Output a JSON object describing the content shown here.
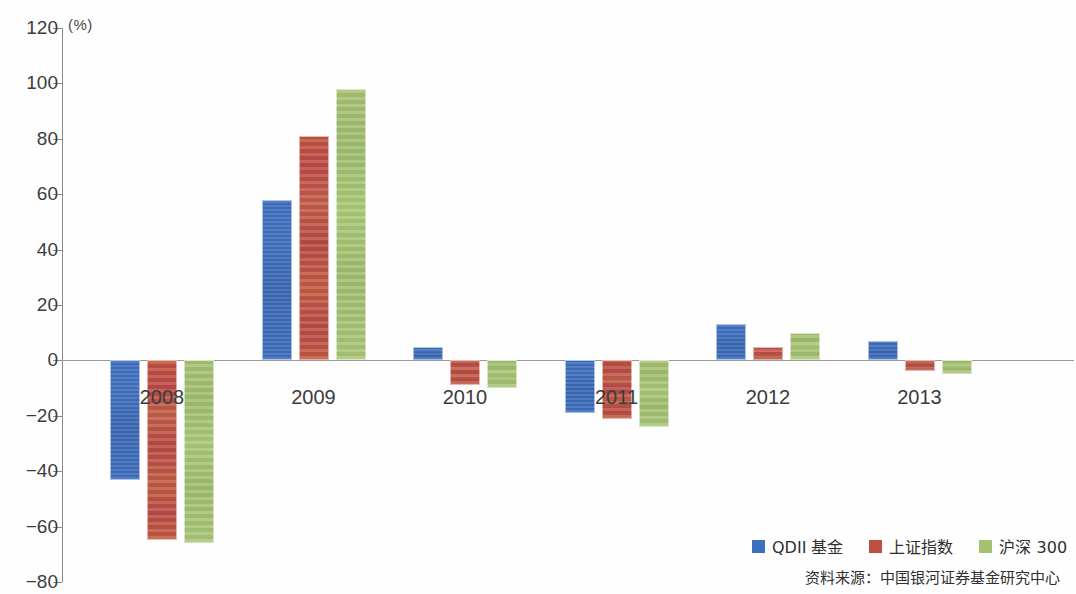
{
  "axis": {
    "unit_label": "(%)",
    "y_ticks": [
      120,
      100,
      80,
      60,
      40,
      20,
      0,
      -20,
      -40,
      -60,
      -80
    ],
    "y_tick_labels": [
      "120",
      "100",
      "80",
      "60",
      "40",
      "20",
      "0",
      "−20",
      "−40",
      "−60",
      "−80"
    ]
  },
  "legend": {
    "items": [
      {
        "label": "QDII 基金",
        "color": "#3f6fbf"
      },
      {
        "label": "上证指数",
        "color": "#bd5043"
      },
      {
        "label": "沪深 300",
        "color": "#a5c273"
      }
    ]
  },
  "source_note": "资料来源：中国银河证券基金研究中心",
  "chart_data": {
    "type": "bar",
    "title": "",
    "xlabel": "",
    "ylabel": "(%)",
    "ylim": [
      -80,
      120
    ],
    "ytick_step": 20,
    "grid": false,
    "legend_position": "bottom-right",
    "categories": [
      "2008",
      "2009",
      "2010",
      "2011",
      "2012",
      "2013"
    ],
    "series": [
      {
        "name": "QDII 基金",
        "color": "#3f6fbf",
        "values": [
          -43,
          58,
          5,
          -19,
          13,
          7
        ]
      },
      {
        "name": "上证指数",
        "color": "#bd5043",
        "values": [
          -65,
          81,
          -9,
          -21,
          5,
          -4
        ]
      },
      {
        "name": "沪深 300",
        "color": "#a5c273",
        "values": [
          -66,
          98,
          -10,
          -24,
          10,
          -5
        ]
      }
    ]
  }
}
